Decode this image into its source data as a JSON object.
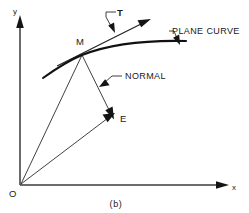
{
  "figure": {
    "caption": "(b)",
    "axes": {
      "y_label": "y",
      "x_label": "x",
      "origin_label": "O"
    },
    "points": [
      {
        "id": "M",
        "label": "M",
        "description": "point on plane curve"
      },
      {
        "id": "E",
        "label": "E",
        "description": "endpoint of normal vector"
      },
      {
        "id": "O",
        "label": "O",
        "description": "origin"
      }
    ],
    "annotations": [
      {
        "id": "tangent",
        "label": "T",
        "bold": true,
        "description": "tangent unit vector at M"
      },
      {
        "id": "plane-curve",
        "label": "PLANE CURVE",
        "description": "label for the curve"
      },
      {
        "id": "normal",
        "label": "NORMAL",
        "description": "label for the normal line from M to E"
      }
    ],
    "vectors": [
      {
        "from": "O",
        "to": "M",
        "description": "position vector to curve point"
      },
      {
        "from": "O",
        "to": "E",
        "description": "position vector to E"
      },
      {
        "from": "M",
        "to": "E",
        "description": "normal from M to E"
      }
    ]
  }
}
